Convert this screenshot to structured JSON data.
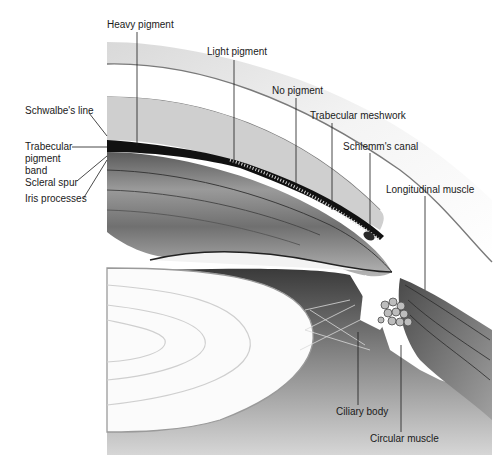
{
  "figure": {
    "colors": {
      "background": "#ffffff",
      "tissue_dark": "#1a1a1a",
      "tissue_mid": "#6e6e6e",
      "tissue_light": "#c8c8c8",
      "lens": "#fafafa",
      "label_text": "#1a1a1a"
    }
  },
  "labels": {
    "heavy_pigment": "Heavy pigment",
    "light_pigment": "Light pigment",
    "no_pigment": "No pigment",
    "trabecular_meshwork": "Trabecular meshwork",
    "schlemms_canal": "Schlemm's canal",
    "longitudinal_muscle": "Longitudinal muscle",
    "schwalbes_line": "Schwalbe's line",
    "trabecular_pigment_band": "Trabecular\npigment\nband",
    "scleral_spur": "Scleral spur",
    "iris_processes": "Iris processes",
    "ciliary_body": "Ciliary body",
    "circular_muscle": "Circular muscle"
  }
}
